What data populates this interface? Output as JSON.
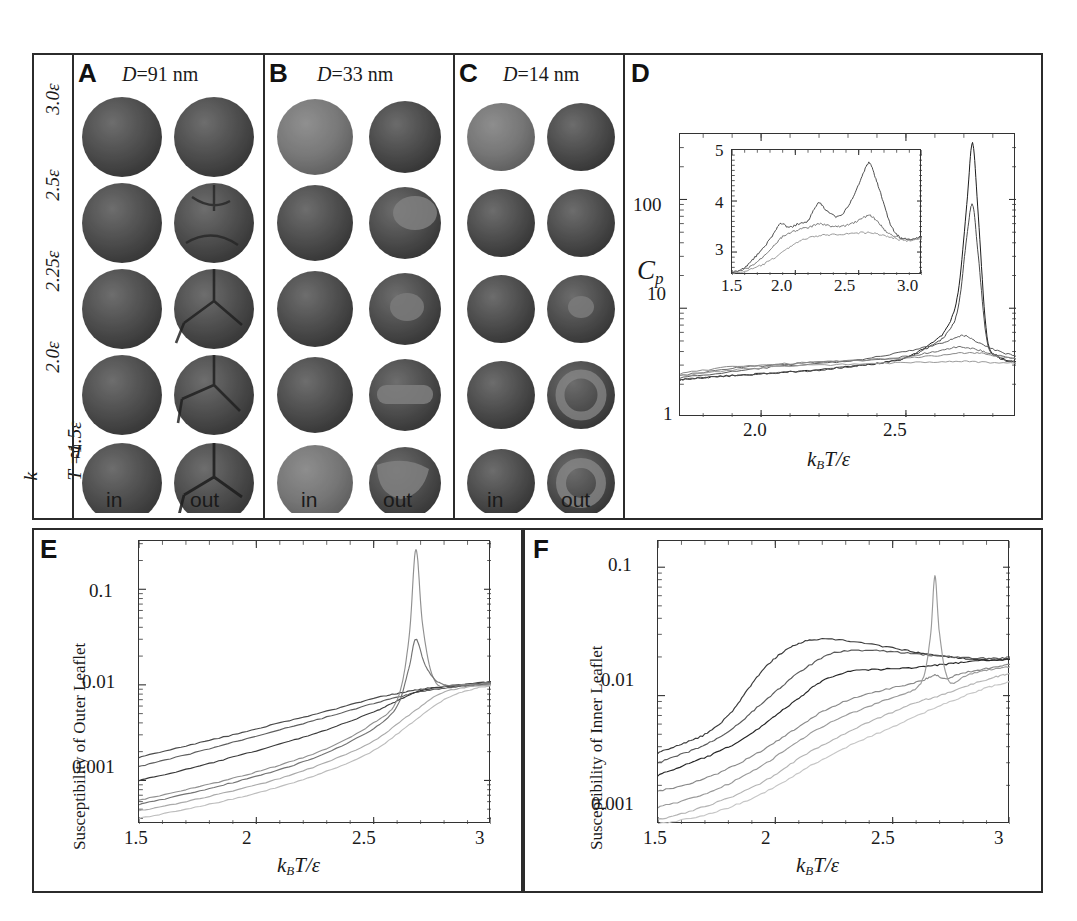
{
  "figure": {
    "panels": [
      {
        "id": "A",
        "title_prefix": "D",
        "title_rest": "=91 nm",
        "label": "A"
      },
      {
        "id": "B",
        "title_prefix": "D",
        "title_rest": "=33 nm",
        "label": "B"
      },
      {
        "id": "C",
        "title_prefix": "D",
        "title_rest": "=14 nm",
        "label": "C"
      },
      {
        "id": "D",
        "label": "D"
      },
      {
        "id": "E",
        "label": "E"
      },
      {
        "id": "F",
        "label": "F"
      }
    ],
    "row_labels": [
      "3.0ε",
      "2.5ε",
      "2.25ε",
      "2.0ε"
    ],
    "row_label_bottom_prefix": "k",
    "row_label_bottom_sub": "B",
    "row_label_bottom_rest": "T =1.5ε",
    "column_labels": [
      "in",
      "out"
    ],
    "axis_label_kbt": {
      "k": "k",
      "sub": "B",
      "rest": "T/ε"
    }
  },
  "chart_data": [
    {
      "id": "D",
      "type": "line",
      "title": "",
      "xlabel": "k_B T/ε",
      "ylabel": "C_p",
      "yscale": "log",
      "ylim": [
        1,
        400
      ],
      "xlim": [
        1.72,
        2.88
      ],
      "ytick_labels": [
        "1",
        "10",
        "100"
      ],
      "ytick_values": [
        1,
        10,
        100
      ],
      "xtick_labels": [
        "2.0",
        "2.5"
      ],
      "xtick_values": [
        2.0,
        2.5
      ],
      "grid": false,
      "legend": "none",
      "series": [
        {
          "name": "D=91 nm out",
          "color": "#1d1d1d",
          "peak_x": 2.73,
          "peak_y": 330,
          "x": [
            1.72,
            1.8,
            1.9,
            2.0,
            2.1,
            2.2,
            2.3,
            2.4,
            2.5,
            2.58,
            2.64,
            2.68,
            2.71,
            2.73,
            2.75,
            2.78,
            2.82,
            2.88
          ],
          "y": [
            2.2,
            2.3,
            2.4,
            2.5,
            2.6,
            2.7,
            2.9,
            3.1,
            3.5,
            4.6,
            6.5,
            14,
            90,
            330,
            70,
            5.5,
            3.6,
            3.2
          ]
        },
        {
          "name": "D=91 nm in",
          "color": "#4a4a4a",
          "peak_x": 2.72,
          "peak_y": 90,
          "x": [
            1.72,
            1.8,
            1.9,
            2.0,
            2.1,
            2.2,
            2.3,
            2.4,
            2.5,
            2.58,
            2.64,
            2.68,
            2.71,
            2.73,
            2.75,
            2.78,
            2.82,
            2.88
          ],
          "y": [
            2.2,
            2.3,
            2.4,
            2.5,
            2.6,
            2.7,
            2.9,
            3.1,
            3.5,
            4.4,
            5.8,
            10,
            45,
            90,
            30,
            5.0,
            3.5,
            3.2
          ]
        },
        {
          "name": "D=33 nm out",
          "color": "#5a5a5a",
          "x": [
            1.72,
            1.9,
            2.05,
            2.2,
            2.35,
            2.5,
            2.6,
            2.66,
            2.7,
            2.74,
            2.8,
            2.88
          ],
          "y": [
            2.3,
            2.6,
            2.9,
            3.1,
            3.4,
            4.0,
            4.6,
            5.2,
            5.6,
            5.0,
            4.2,
            3.6
          ]
        },
        {
          "name": "D=33 nm in",
          "color": "#6e6e6e",
          "x": [
            1.72,
            1.9,
            2.05,
            2.2,
            2.35,
            2.5,
            2.6,
            2.68,
            2.74,
            2.8,
            2.88
          ],
          "y": [
            2.4,
            2.8,
            3.0,
            3.2,
            3.3,
            3.6,
            4.0,
            4.4,
            4.2,
            3.8,
            3.4
          ]
        },
        {
          "name": "D=14 nm out",
          "color": "#8a8a8a",
          "x": [
            1.72,
            1.9,
            2.1,
            2.3,
            2.5,
            2.62,
            2.72,
            2.8,
            2.88
          ],
          "y": [
            2.5,
            2.9,
            3.1,
            3.3,
            3.5,
            3.7,
            3.9,
            3.7,
            3.4
          ]
        },
        {
          "name": "D=14 nm in",
          "color": "#9c9c9c",
          "x": [
            1.72,
            1.9,
            2.1,
            2.3,
            2.5,
            2.65,
            2.75,
            2.88
          ],
          "y": [
            2.4,
            2.7,
            2.95,
            3.05,
            3.15,
            3.25,
            3.2,
            3.1
          ]
        }
      ],
      "inset": {
        "type": "line",
        "xlim": [
          1.5,
          3.0
        ],
        "ylim": [
          2.55,
          5.0
        ],
        "xtick_labels": [
          "1.5",
          "2.0",
          "2.5",
          "3.0"
        ],
        "xtick_values": [
          1.5,
          2.0,
          2.5,
          3.0
        ],
        "ytick_labels": [
          "3",
          "4",
          "5"
        ],
        "ytick_values": [
          3,
          4,
          5
        ],
        "series": [
          {
            "name": "peaked",
            "color": "#3a3a3a",
            "x": [
              1.5,
              1.6,
              1.7,
              1.8,
              1.88,
              1.95,
              2.02,
              2.1,
              2.18,
              2.25,
              2.35,
              2.45,
              2.52,
              2.58,
              2.62,
              2.68,
              2.75,
              2.82,
              2.9,
              3.0
            ],
            "y": [
              2.6,
              2.7,
              2.95,
              3.25,
              3.55,
              3.48,
              3.55,
              3.62,
              3.95,
              3.8,
              3.7,
              4.05,
              4.45,
              4.75,
              4.55,
              4.1,
              3.55,
              3.3,
              3.25,
              3.3
            ]
          },
          {
            "name": "mid",
            "color": "#6a6a6a",
            "x": [
              1.5,
              1.62,
              1.72,
              1.82,
              1.9,
              2.0,
              2.1,
              2.2,
              2.3,
              2.4,
              2.5,
              2.58,
              2.64,
              2.72,
              2.8,
              2.9,
              3.0
            ],
            "y": [
              2.58,
              2.68,
              2.85,
              3.1,
              3.3,
              3.42,
              3.48,
              3.55,
              3.5,
              3.52,
              3.62,
              3.72,
              3.62,
              3.4,
              3.3,
              3.25,
              3.28
            ]
          },
          {
            "name": "flat",
            "color": "#8e8e8e",
            "x": [
              1.5,
              1.65,
              1.78,
              1.9,
              2.02,
              2.15,
              2.28,
              2.42,
              2.55,
              2.66,
              2.76,
              2.88,
              3.0
            ],
            "y": [
              2.57,
              2.66,
              2.8,
              3.0,
              3.2,
              3.3,
              3.34,
              3.36,
              3.38,
              3.35,
              3.28,
              3.22,
              3.25
            ]
          }
        ]
      }
    },
    {
      "id": "E",
      "type": "line",
      "xlabel": "k_B T/ε",
      "ylabel": "Susceptibility of Outer Leaflet",
      "yscale": "log",
      "ylim": [
        0.00035,
        0.32
      ],
      "xlim": [
        1.5,
        3.0
      ],
      "ytick_labels": [
        "0.001",
        "0.01",
        "0.1"
      ],
      "ytick_values": [
        0.001,
        0.01,
        0.1
      ],
      "xtick_labels": [
        "1.5",
        "2",
        "2.5",
        "3"
      ],
      "xtick_values": [
        1.5,
        2.0,
        2.5,
        3.0
      ],
      "grid": false,
      "series": [
        {
          "name": "s1",
          "color": "#4a4a4a",
          "x": [
            1.5,
            1.7,
            1.9,
            2.1,
            2.3,
            2.5,
            2.62,
            2.7,
            2.8,
            2.9,
            3.0
          ],
          "y": [
            0.00175,
            0.0023,
            0.003,
            0.004,
            0.0053,
            0.0072,
            0.0083,
            0.009,
            0.0096,
            0.0102,
            0.0108
          ]
        },
        {
          "name": "s2",
          "color": "#5e5e5e",
          "x": [
            1.5,
            1.7,
            1.9,
            2.1,
            2.3,
            2.5,
            2.62,
            2.7,
            2.8,
            2.9,
            3.0
          ],
          "y": [
            0.0014,
            0.00185,
            0.0025,
            0.0034,
            0.0046,
            0.0064,
            0.0076,
            0.0085,
            0.0092,
            0.0098,
            0.0104
          ]
        },
        {
          "name": "s3",
          "color": "#3a3a3a",
          "x": [
            1.5,
            1.7,
            1.9,
            2.1,
            2.3,
            2.5,
            2.6,
            2.68,
            2.78,
            2.9,
            3.0
          ],
          "y": [
            0.001,
            0.0013,
            0.00175,
            0.0024,
            0.0034,
            0.0052,
            0.0068,
            0.0084,
            0.0094,
            0.01,
            0.0106
          ]
        },
        {
          "name": "s4-peak",
          "color": "#909090",
          "peak_x": 2.68,
          "peak_y": 0.26,
          "x": [
            1.5,
            1.7,
            1.9,
            2.1,
            2.3,
            2.5,
            2.6,
            2.65,
            2.68,
            2.71,
            2.76,
            2.85,
            3.0
          ],
          "y": [
            0.00062,
            0.0008,
            0.00105,
            0.00145,
            0.00215,
            0.004,
            0.007,
            0.03,
            0.26,
            0.04,
            0.011,
            0.01,
            0.0105
          ]
        },
        {
          "name": "s5-peak",
          "color": "#737373",
          "peak_x": 2.68,
          "peak_y": 0.03,
          "x": [
            1.5,
            1.7,
            1.9,
            2.1,
            2.3,
            2.5,
            2.6,
            2.65,
            2.68,
            2.72,
            2.78,
            2.88,
            3.0
          ],
          "y": [
            0.00056,
            0.00072,
            0.00095,
            0.0013,
            0.00195,
            0.0035,
            0.006,
            0.015,
            0.03,
            0.016,
            0.0105,
            0.0098,
            0.0102
          ]
        },
        {
          "name": "s6",
          "color": "#aaaaaa",
          "x": [
            1.5,
            1.7,
            1.9,
            2.1,
            2.3,
            2.5,
            2.65,
            2.78,
            2.9,
            3.0
          ],
          "y": [
            0.00048,
            0.0006,
            0.00078,
            0.00105,
            0.00155,
            0.0026,
            0.0048,
            0.008,
            0.0095,
            0.01
          ]
        },
        {
          "name": "s7",
          "color": "#bdbdbd",
          "x": [
            1.5,
            1.7,
            1.9,
            2.1,
            2.3,
            2.5,
            2.65,
            2.8,
            2.92,
            3.0
          ],
          "y": [
            0.0004,
            0.0005,
            0.00064,
            0.00086,
            0.00125,
            0.00205,
            0.0038,
            0.007,
            0.009,
            0.0098
          ]
        }
      ]
    },
    {
      "id": "F",
      "type": "line",
      "xlabel": "k_B T/ε",
      "ylabel": "Susceptibility of Inner Leaflet",
      "yscale": "log",
      "ylim": [
        0.001,
        0.16
      ],
      "xlim": [
        1.5,
        3.0
      ],
      "ytick_labels": [
        "0.001",
        "0.01",
        "0.1"
      ],
      "ytick_values": [
        0.001,
        0.01,
        0.1
      ],
      "xtick_labels": [
        "1.5",
        "2",
        "2.5",
        "3"
      ],
      "xtick_values": [
        1.5,
        2.0,
        2.5,
        3.0
      ],
      "grid": false,
      "series": [
        {
          "name": "f1",
          "color": "#3a3a3a",
          "x": [
            1.5,
            1.6,
            1.7,
            1.8,
            1.88,
            1.95,
            2.02,
            2.1,
            2.2,
            2.35,
            2.5,
            2.62,
            2.7,
            2.8,
            2.9,
            3.0
          ],
          "y": [
            0.0036,
            0.0042,
            0.005,
            0.007,
            0.011,
            0.016,
            0.021,
            0.0255,
            0.0275,
            0.026,
            0.0235,
            0.0215,
            0.0205,
            0.0195,
            0.019,
            0.0192
          ]
        },
        {
          "name": "f2",
          "color": "#5a5a5a",
          "x": [
            1.5,
            1.62,
            1.72,
            1.82,
            1.92,
            2.02,
            2.12,
            2.25,
            2.4,
            2.55,
            2.68,
            2.8,
            2.92,
            3.0
          ],
          "y": [
            0.003,
            0.0036,
            0.0043,
            0.0056,
            0.008,
            0.0115,
            0.016,
            0.0215,
            0.0225,
            0.0215,
            0.0205,
            0.0198,
            0.0195,
            0.0196
          ]
        },
        {
          "name": "f3",
          "color": "#262626",
          "x": [
            1.5,
            1.62,
            1.75,
            1.88,
            2.0,
            2.1,
            2.2,
            2.32,
            2.45,
            2.58,
            2.68,
            2.78,
            2.9,
            3.0
          ],
          "y": [
            0.0024,
            0.0029,
            0.0036,
            0.0048,
            0.007,
            0.0095,
            0.013,
            0.0155,
            0.016,
            0.0165,
            0.0172,
            0.018,
            0.0188,
            0.0192
          ]
        },
        {
          "name": "f4",
          "color": "#8a8a8a",
          "x": [
            1.5,
            1.65,
            1.8,
            1.95,
            2.08,
            2.2,
            2.35,
            2.5,
            2.62,
            2.68,
            2.72,
            2.8,
            2.92,
            3.0
          ],
          "y": [
            0.0018,
            0.0021,
            0.0027,
            0.0038,
            0.0054,
            0.0075,
            0.0098,
            0.0115,
            0.013,
            0.0145,
            0.0135,
            0.015,
            0.0165,
            0.0175
          ]
        },
        {
          "name": "f5-peak",
          "color": "#9a9a9a",
          "peak_x": 2.68,
          "peak_y": 0.085,
          "x": [
            1.5,
            1.65,
            1.8,
            1.95,
            2.08,
            2.22,
            2.38,
            2.52,
            2.62,
            2.66,
            2.68,
            2.7,
            2.74,
            2.82,
            2.92,
            3.0
          ],
          "y": [
            0.00135,
            0.0016,
            0.00205,
            0.0029,
            0.0042,
            0.006,
            0.008,
            0.01,
            0.0125,
            0.028,
            0.085,
            0.03,
            0.013,
            0.0145,
            0.016,
            0.0168
          ]
        },
        {
          "name": "f6",
          "color": "#b4b4b4",
          "x": [
            1.5,
            1.65,
            1.82,
            1.98,
            2.12,
            2.28,
            2.45,
            2.6,
            2.7,
            2.82,
            2.94,
            3.0
          ],
          "y": [
            0.00108,
            0.00128,
            0.00165,
            0.0023,
            0.0034,
            0.0049,
            0.0068,
            0.0088,
            0.01,
            0.012,
            0.014,
            0.0148
          ]
        },
        {
          "name": "f7",
          "color": "#c6c6c6",
          "x": [
            1.5,
            1.68,
            1.85,
            2.0,
            2.15,
            2.32,
            2.5,
            2.65,
            2.78,
            2.9,
            3.0
          ],
          "y": [
            0.001,
            0.00115,
            0.00145,
            0.00195,
            0.00285,
            0.0041,
            0.0057,
            0.0076,
            0.0095,
            0.0115,
            0.0128
          ]
        }
      ]
    }
  ],
  "vesicles": {
    "note": "simulation snapshots of vesicle inner/outer leaflets",
    "rows": [
      {
        "temp": "3.0ε",
        "A": [
          "mixed",
          "mixed"
        ],
        "B": [
          "mixed",
          "mixed"
        ],
        "C": [
          "mixed",
          "mixed"
        ]
      },
      {
        "temp": "2.5ε",
        "A": [
          "mixed",
          "patchy"
        ],
        "B": [
          "mixed",
          "domain"
        ],
        "C": [
          "mixed",
          "mixed"
        ]
      },
      {
        "temp": "2.25ε",
        "A": [
          "mixed",
          "domains"
        ],
        "B": [
          "mixed",
          "domain"
        ],
        "C": [
          "mixed",
          "spot"
        ]
      },
      {
        "temp": "2.0ε",
        "A": [
          "mixed",
          "domains"
        ],
        "B": [
          "mixed",
          "stripe"
        ],
        "C": [
          "mixed",
          "ring"
        ]
      },
      {
        "temp": "1.5ε",
        "A": [
          "mixed",
          "domains"
        ],
        "B": [
          "light",
          "patch"
        ],
        "C": [
          "mixed",
          "ring"
        ]
      }
    ]
  },
  "colors": {
    "border": "#2b2b2b",
    "axis": "#333333",
    "text": "#1a1a1a",
    "vesicle_dark": "#4e4e4e",
    "vesicle_mid": "#6b6b6b",
    "vesicle_light": "#8d8d8d"
  }
}
